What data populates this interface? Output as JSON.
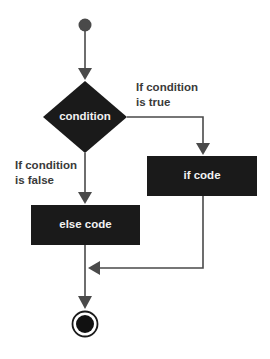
{
  "diagram": {
    "type": "flowchart",
    "colors": {
      "node_fill": "#1a1a1a",
      "node_text": "#f2f2f2",
      "edge": "#4a4a4a",
      "label_text": "#3a3a3a",
      "background": "#ffffff"
    },
    "nodes": {
      "start": {
        "kind": "initial-state"
      },
      "condition": {
        "kind": "decision",
        "label": "condition"
      },
      "if_code": {
        "kind": "process",
        "label": "if code"
      },
      "else_code": {
        "kind": "process",
        "label": "else code"
      },
      "end": {
        "kind": "final-state"
      }
    },
    "edges": {
      "true_label": {
        "line1": "If condition",
        "line2": "is true"
      },
      "false_label": {
        "line1": "If condition",
        "line2": "is false"
      }
    }
  }
}
